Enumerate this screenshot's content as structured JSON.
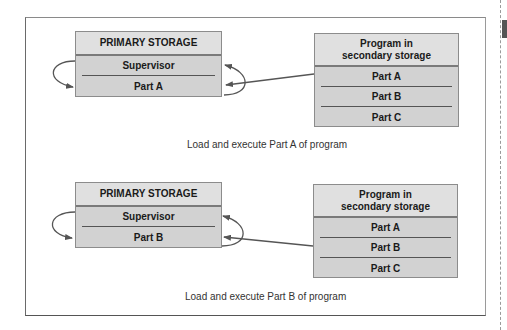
{
  "panels": [
    {
      "primary_storage": {
        "title": "PRIMARY STORAGE",
        "rows": [
          "Supervisor",
          "Part A"
        ]
      },
      "secondary_storage": {
        "title_line1": "Program in",
        "title_line2": "secondary storage",
        "rows": [
          "Part A",
          "Part B",
          "Part C"
        ]
      },
      "caption": "Load and execute Part A of program",
      "loaded_part": "Part A"
    },
    {
      "primary_storage": {
        "title": "PRIMARY STORAGE",
        "rows": [
          "Supervisor",
          "Part B"
        ]
      },
      "secondary_storage": {
        "title_line1": "Program in",
        "title_line2": "secondary storage",
        "rows": [
          "Part A",
          "Part B",
          "Part C"
        ]
      },
      "caption": "Load and execute Part B of program",
      "loaded_part": "Part B"
    }
  ],
  "colors": {
    "box_header": "#e0e0e0",
    "box_body": "#d2d2d2",
    "border": "#8c8c8c",
    "arrow": "#555555",
    "text": "#1a1a1a"
  }
}
